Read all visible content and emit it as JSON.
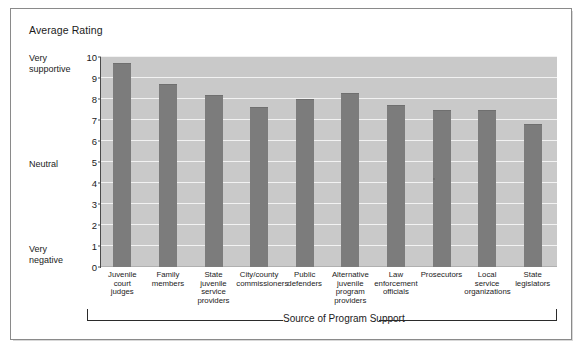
{
  "figure": {
    "title": "Average Rating",
    "y_anchor_high": "Very\nsupportive",
    "y_anchor_mid": "Neutral",
    "y_anchor_low": "Very\nnegative",
    "x_axis_title": "Source of Program Support",
    "colors": {
      "bar": "#7c7c7c",
      "plot_background": "#c9c9c9",
      "gridline": "#f2f2f2",
      "frame": "#8a8a8a",
      "text": "#1b1b1b"
    }
  },
  "chart_data": {
    "type": "bar",
    "title": "Average Rating",
    "xlabel": "Source of Program Support",
    "ylabel": "Average Rating",
    "ylim": [
      0,
      10
    ],
    "yticks": [
      0,
      1,
      2,
      3,
      4,
      5,
      6,
      7,
      8,
      9,
      10
    ],
    "ytick_labels": [
      "0",
      "1",
      "2",
      "3",
      "4",
      "5",
      "6",
      "7",
      "8",
      "9",
      "10"
    ],
    "y_axis_anchors": [
      {
        "value": 10,
        "label": "Very supportive"
      },
      {
        "value": 5,
        "label": "Neutral"
      },
      {
        "value": 0,
        "label": "Very negative"
      }
    ],
    "grid": true,
    "legend": null,
    "categories": [
      "Juvenile\ncourt\njudges",
      "Family\nmembers",
      "State\njuvenile\nservice\nproviders",
      "City/county\ncommissioners",
      "Public\ndefenders",
      "Alternative\njuvenile\nprogram\nproviders",
      "Law\nenforcement\nofficials",
      "Prosecutors",
      "Local\nservice\norganizations",
      "State\nlegislators"
    ],
    "values": [
      9.7,
      8.7,
      8.2,
      7.6,
      8.0,
      8.3,
      7.7,
      7.5,
      7.5,
      6.8
    ]
  }
}
